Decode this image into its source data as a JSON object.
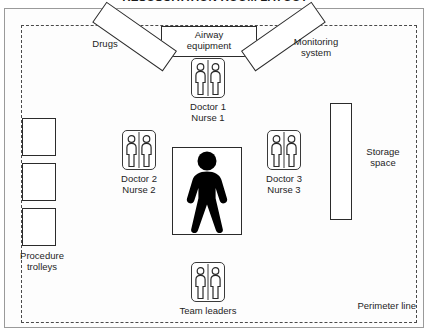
{
  "diagram": {
    "title": "RESUSCITATION ROOM LAYOUT",
    "perimeter_label": "Perimeter line"
  },
  "equipment": {
    "airway": "Airway\nequipment",
    "drugs": "Drugs",
    "monitoring": "Monitoring\nsystem",
    "storage": "Storage\nspace",
    "procedure_trolleys": "Procedure\ntrolleys"
  },
  "staff": [
    {
      "id": "staff-top",
      "label": "Doctor 1\nNurse 1",
      "icon": "two-people-icon"
    },
    {
      "id": "staff-left",
      "label": "Doctor 2\nNurse 2",
      "icon": "two-people-icon"
    },
    {
      "id": "staff-right",
      "label": "Doctor 3\nNurse 3",
      "icon": "two-people-icon"
    },
    {
      "id": "staff-bottom",
      "label": "Team leaders",
      "icon": "two-people-icon"
    }
  ],
  "patient": {
    "icon": "patient-silhouette-icon"
  },
  "colors": {
    "outline": "#2b2b2b",
    "perimeter": "#4a4a4a",
    "patient": "#000000",
    "background": "#ffffff"
  }
}
